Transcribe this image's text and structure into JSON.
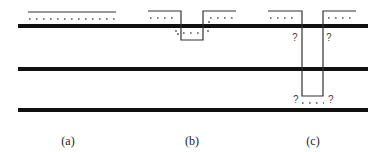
{
  "diagram": {
    "panels": [
      {
        "id": "a",
        "caption": "(a)"
      },
      {
        "id": "b",
        "caption": "(b)"
      },
      {
        "id": "c",
        "caption": "(c)"
      }
    ],
    "annotations": {
      "unknown_marker": "?",
      "dots_short": ". . . .",
      "dots_long": ". . . . . . . . . . . . . ."
    },
    "colors": {
      "line": "#111111",
      "thin_line": "#333333",
      "background": "#ffffff"
    }
  }
}
